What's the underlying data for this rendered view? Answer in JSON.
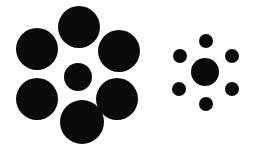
{
  "figure": {
    "name": "ebbinghaus-illusion",
    "background_color": "#ffffff",
    "circle_color": "#0a0a0a",
    "width": 258,
    "height": 152
  },
  "chart_data": {
    "type": "scatter",
    "title": "",
    "xlabel": "",
    "ylabel": "",
    "xlim": [
      0,
      258
    ],
    "ylim": [
      0,
      152
    ],
    "grid": false,
    "legend": null,
    "groups": [
      {
        "name": "left-cluster",
        "label": "Left cluster: small target surrounded by large inducers",
        "target": {
          "name": "left-target-circle",
          "cx": 78,
          "cy": 77,
          "r": 14,
          "diameter": 28,
          "color": "#0a0a0a"
        },
        "inducers": [
          {
            "name": "left-inducer-top",
            "cx": 79,
            "cy": 27,
            "r": 21,
            "diameter": 42,
            "color": "#0a0a0a"
          },
          {
            "name": "left-inducer-upper-right",
            "cx": 119,
            "cy": 51,
            "r": 21,
            "diameter": 42,
            "color": "#0a0a0a"
          },
          {
            "name": "left-inducer-lower-right",
            "cx": 117,
            "cy": 99,
            "r": 21,
            "diameter": 42,
            "color": "#0a0a0a"
          },
          {
            "name": "left-inducer-bottom",
            "cx": 82,
            "cy": 122,
            "r": 22,
            "diameter": 44,
            "color": "#0a0a0a"
          },
          {
            "name": "left-inducer-lower-left",
            "cx": 37,
            "cy": 99,
            "r": 21,
            "diameter": 42,
            "color": "#0a0a0a"
          },
          {
            "name": "left-inducer-upper-left",
            "cx": 37,
            "cy": 49,
            "r": 21,
            "diameter": 42,
            "color": "#0a0a0a"
          }
        ]
      },
      {
        "name": "right-cluster",
        "label": "Right cluster: same-size target surrounded by small inducers",
        "target": {
          "name": "right-target-circle",
          "cx": 205,
          "cy": 72,
          "r": 14,
          "diameter": 28,
          "color": "#0a0a0a"
        },
        "inducers": [
          {
            "name": "right-inducer-top",
            "cx": 206,
            "cy": 41,
            "r": 7,
            "diameter": 14,
            "color": "#0a0a0a"
          },
          {
            "name": "right-inducer-upper-right",
            "cx": 232,
            "cy": 56,
            "r": 7,
            "diameter": 14,
            "color": "#0a0a0a"
          },
          {
            "name": "right-inducer-lower-right",
            "cx": 232,
            "cy": 89,
            "r": 7,
            "diameter": 14,
            "color": "#0a0a0a"
          },
          {
            "name": "right-inducer-bottom",
            "cx": 206,
            "cy": 104,
            "r": 7,
            "diameter": 14,
            "color": "#0a0a0a"
          },
          {
            "name": "right-inducer-lower-left",
            "cx": 179,
            "cy": 89,
            "r": 7,
            "diameter": 14,
            "color": "#0a0a0a"
          },
          {
            "name": "right-inducer-upper-left",
            "cx": 180,
            "cy": 56,
            "r": 7,
            "diameter": 14,
            "color": "#0a0a0a"
          }
        ]
      }
    ]
  }
}
